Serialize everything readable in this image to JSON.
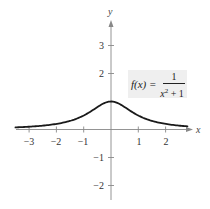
{
  "chart_data": {
    "type": "line",
    "title": "",
    "annotation": "f(x) = 1 / (x^2 + 1)",
    "function": "f(x) = 1/(x^2+1)",
    "xlabel": "x",
    "ylabel": "y",
    "xlim": [
      -3.5,
      2.8
    ],
    "ylim": [
      -2.5,
      4
    ],
    "xticks": [
      -3,
      -2,
      -1,
      1,
      2
    ],
    "yticks": [
      -2,
      -1,
      2,
      3
    ],
    "grid": false,
    "legend": null,
    "series": [
      {
        "name": "f(x) = 1/(x^2+1)",
        "x": [
          -3.5,
          -3,
          -2.5,
          -2,
          -1.5,
          -1,
          -0.5,
          0,
          0.5,
          1,
          1.5,
          2,
          2.5,
          2.8
        ],
        "y": [
          0.075,
          0.1,
          0.138,
          0.2,
          0.308,
          0.5,
          0.8,
          1.0,
          0.8,
          0.5,
          0.308,
          0.2,
          0.138,
          0.113
        ]
      }
    ]
  },
  "axes": {
    "x_label": "x",
    "y_label": "y",
    "x_tick_labels": [
      "−3",
      "−2",
      "−1",
      "1",
      "2"
    ],
    "y_tick_labels": [
      "3",
      "2",
      "−1",
      "−2"
    ]
  },
  "formula": {
    "lhs": "f(x) =",
    "numerator": "1",
    "denominator_base": "x",
    "denominator_exp": "2",
    "denominator_rest": " + 1"
  }
}
